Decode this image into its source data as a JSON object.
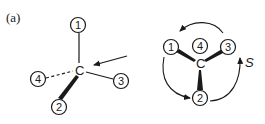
{
  "panel_label": "(a)",
  "left_view": {
    "center_atom": "C",
    "substituents": [
      {
        "priority": "1",
        "bond": "plain",
        "position": "top"
      },
      {
        "priority": "2",
        "bond": "wedge",
        "position": "bottom-left"
      },
      {
        "priority": "3",
        "bond": "plain",
        "position": "right"
      },
      {
        "priority": "4",
        "bond": "dashed",
        "position": "left"
      }
    ],
    "viewing_arrow": "viewing direction arrow toward C"
  },
  "right_view": {
    "center_atom": "C",
    "substituents": [
      {
        "priority": "1",
        "bond": "wedge",
        "position": "upper-left"
      },
      {
        "priority": "4",
        "bond": "behind",
        "position": "top-center"
      },
      {
        "priority": "3",
        "bond": "wedge",
        "position": "upper-right"
      },
      {
        "priority": "2",
        "bond": "wedge",
        "position": "bottom"
      }
    ],
    "rotation_arrows": "1 → 2 → 3 circular",
    "configuration_label": "S"
  },
  "colors": {
    "ink": "#1a1a1a",
    "background": "#ffffff"
  }
}
